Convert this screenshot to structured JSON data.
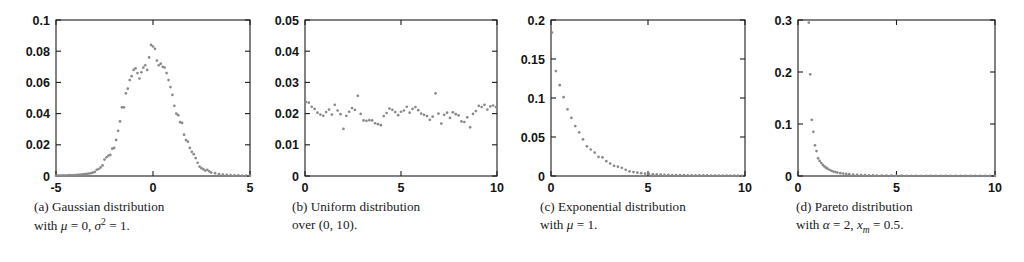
{
  "figure": {
    "background": "#ffffff",
    "marker_color": "#8a8a8a",
    "axis_color": "#1c1c1c",
    "panel_count": 4
  },
  "chart_data": [
    {
      "type": "scatter",
      "panel": "a",
      "title": "",
      "caption_line1": "(a) Gaussian distribution",
      "caption_line2_prefix": "with ",
      "caption_mu": "μ",
      "caption_line2_mid": " = 0, ",
      "caption_sigma": "σ",
      "caption_sigma_sup": "2",
      "caption_line2_end": " = 1.",
      "xlabel": "",
      "ylabel": "",
      "xlim": [
        -5,
        5
      ],
      "ylim": [
        0,
        0.1
      ],
      "xticks": [
        -5,
        0,
        5
      ],
      "xticklabels": [
        "-5",
        "0",
        "5"
      ],
      "yticks": [
        0,
        0.02,
        0.04,
        0.06,
        0.08,
        0.1
      ],
      "yticklabels": [
        "0",
        "0.02",
        "0.04",
        "0.06",
        "0.08",
        "0.1"
      ],
      "grid": false,
      "legend": null,
      "x": [
        -5.0,
        -4.9,
        -4.8,
        -4.7,
        -4.6,
        -4.5,
        -4.4,
        -4.3,
        -4.2,
        -4.1,
        -4.0,
        -3.9,
        -3.8,
        -3.7,
        -3.6,
        -3.5,
        -3.4,
        -3.3,
        -3.2,
        -3.1,
        -3.0,
        -2.9,
        -2.8,
        -2.7,
        -2.6,
        -2.5,
        -2.4,
        -2.3,
        -2.2,
        -2.1,
        -2.0,
        -1.9,
        -1.8,
        -1.7,
        -1.6,
        -1.5,
        -1.4,
        -1.3,
        -1.2,
        -1.1,
        -1.0,
        -0.9,
        -0.8,
        -0.7,
        -0.6,
        -0.5,
        -0.4,
        -0.3,
        -0.2,
        -0.1,
        0.0,
        0.1,
        0.2,
        0.3,
        0.4,
        0.5,
        0.6,
        0.7,
        0.8,
        0.9,
        1.0,
        1.1,
        1.2,
        1.3,
        1.4,
        1.5,
        1.6,
        1.7,
        1.8,
        1.9,
        2.0,
        2.1,
        2.2,
        2.3,
        2.4,
        2.5,
        2.6,
        2.7,
        2.8,
        2.9,
        3.0,
        3.2,
        3.4,
        3.6,
        3.8,
        4.0,
        4.2,
        4.4,
        4.6,
        4.8,
        5.0
      ],
      "y": [
        0.0002,
        0.0003,
        0.0002,
        0.0003,
        0.0004,
        0.0003,
        0.0004,
        0.0005,
        0.0004,
        0.0006,
        0.0006,
        0.0007,
        0.0008,
        0.0009,
        0.001,
        0.0012,
        0.0013,
        0.0016,
        0.0018,
        0.0022,
        0.0026,
        0.004,
        0.0045,
        0.0055,
        0.0068,
        0.0105,
        0.012,
        0.013,
        0.0135,
        0.0175,
        0.018,
        0.0231,
        0.029,
        0.035,
        0.044,
        0.044,
        0.053,
        0.056,
        0.0615,
        0.064,
        0.068,
        0.069,
        0.066,
        0.0625,
        0.0665,
        0.0695,
        0.071,
        0.068,
        0.076,
        0.084,
        0.083,
        0.0815,
        0.074,
        0.071,
        0.072,
        0.07,
        0.0695,
        0.066,
        0.0615,
        0.057,
        0.052,
        0.045,
        0.04,
        0.039,
        0.0345,
        0.034,
        0.0265,
        0.023,
        0.022,
        0.018,
        0.0155,
        0.014,
        0.0115,
        0.0085,
        0.006,
        0.005,
        0.0042,
        0.0035,
        0.004,
        0.003,
        0.0022,
        0.0018,
        0.0012,
        0.0009,
        0.0007,
        0.0005,
        0.0004,
        0.0004,
        0.0003,
        0.0002,
        0.0002
      ]
    },
    {
      "type": "scatter",
      "panel": "b",
      "title": "",
      "caption_line1": "(b) Uniform distribution",
      "caption_line2_plain": "over (0, 10).",
      "xlabel": "",
      "ylabel": "",
      "xlim": [
        0,
        10
      ],
      "ylim": [
        0,
        0.05
      ],
      "xticks": [
        0,
        5,
        10
      ],
      "xticklabels": [
        "0",
        "5",
        "10"
      ],
      "yticks": [
        0,
        0.01,
        0.02,
        0.03,
        0.04,
        0.05
      ],
      "yticklabels": [
        "0",
        "0.01",
        "0.02",
        "0.03",
        "0.04",
        "0.05"
      ],
      "grid": false,
      "legend": null,
      "x": [
        0.05,
        0.2,
        0.35,
        0.5,
        0.65,
        0.8,
        0.95,
        1.1,
        1.25,
        1.4,
        1.55,
        1.7,
        1.85,
        2.0,
        2.15,
        2.3,
        2.45,
        2.6,
        2.75,
        2.9,
        3.05,
        3.2,
        3.35,
        3.5,
        3.65,
        3.8,
        3.95,
        4.1,
        4.25,
        4.4,
        4.55,
        4.7,
        4.85,
        5.0,
        5.15,
        5.3,
        5.45,
        5.6,
        5.75,
        5.9,
        6.05,
        6.2,
        6.35,
        6.5,
        6.65,
        6.8,
        6.95,
        7.1,
        7.25,
        7.4,
        7.55,
        7.7,
        7.85,
        8.0,
        8.15,
        8.3,
        8.45,
        8.6,
        8.75,
        8.9,
        9.05,
        9.2,
        9.35,
        9.5,
        9.65,
        9.8,
        9.95
      ],
      "y": [
        0.0237,
        0.0235,
        0.0222,
        0.0215,
        0.0203,
        0.0197,
        0.0193,
        0.0205,
        0.0213,
        0.0197,
        0.0228,
        0.021,
        0.0198,
        0.0151,
        0.0193,
        0.0206,
        0.0218,
        0.0212,
        0.0257,
        0.0199,
        0.0178,
        0.0177,
        0.0179,
        0.0178,
        0.0169,
        0.0166,
        0.0163,
        0.0192,
        0.0202,
        0.0216,
        0.0212,
        0.0205,
        0.0195,
        0.0206,
        0.021,
        0.0222,
        0.0203,
        0.0215,
        0.0221,
        0.0211,
        0.02,
        0.0196,
        0.0192,
        0.018,
        0.019,
        0.0265,
        0.02,
        0.0168,
        0.0196,
        0.0203,
        0.0186,
        0.0204,
        0.0198,
        0.0194,
        0.0175,
        0.0173,
        0.0188,
        0.0156,
        0.0199,
        0.0208,
        0.0225,
        0.0221,
        0.0228,
        0.0213,
        0.0223,
        0.0226,
        0.0221
      ]
    },
    {
      "type": "scatter",
      "panel": "c",
      "title": "",
      "caption_line1": "(c) Exponential distribution",
      "caption_line2_prefix": "with ",
      "caption_mu": "μ",
      "caption_line2_end": " = 1.",
      "xlabel": "",
      "ylabel": "",
      "xlim": [
        0,
        10
      ],
      "ylim": [
        0,
        0.2
      ],
      "xticks": [
        0,
        5,
        10
      ],
      "xticklabels": [
        "0",
        "5",
        "10"
      ],
      "yticks": [
        0,
        0.05,
        0.1,
        0.15,
        0.2
      ],
      "yticklabels": [
        "0",
        "0.05",
        "0.1",
        "0.15",
        "0.2"
      ],
      "grid": false,
      "legend": null,
      "x": [
        0.05,
        0.25,
        0.45,
        0.65,
        0.85,
        1.05,
        1.25,
        1.45,
        1.65,
        1.85,
        2.05,
        2.25,
        2.45,
        2.65,
        2.85,
        3.05,
        3.25,
        3.45,
        3.65,
        3.85,
        4.05,
        4.25,
        4.45,
        4.65,
        4.85,
        5.05,
        5.25,
        5.45,
        5.65,
        5.85,
        6.05,
        6.25,
        6.45,
        6.65,
        6.85,
        7.05,
        7.25,
        7.45,
        7.65,
        7.85,
        8.05,
        8.25,
        8.45,
        8.65,
        8.85,
        9.05,
        9.25,
        9.45,
        9.65,
        9.85
      ],
      "y": [
        0.184,
        0.1345,
        0.1165,
        0.101,
        0.0855,
        0.0745,
        0.064,
        0.056,
        0.047,
        0.038,
        0.034,
        0.03,
        0.0245,
        0.024,
        0.019,
        0.016,
        0.013,
        0.012,
        0.0105,
        0.008,
        0.006,
        0.005,
        0.0042,
        0.0036,
        0.003,
        0.0026,
        0.0022,
        0.002,
        0.0018,
        0.0016,
        0.0014,
        0.0013,
        0.0012,
        0.0011,
        0.001,
        0.0009,
        0.0009,
        0.0008,
        0.0008,
        0.0007,
        0.0007,
        0.0006,
        0.0006,
        0.0005,
        0.0005,
        0.0005,
        0.0004,
        0.0004,
        0.0004,
        0.0003
      ]
    },
    {
      "type": "scatter",
      "panel": "d",
      "title": "",
      "caption_line1": "(d) Pareto distribution",
      "caption_line2_prefix": "with ",
      "caption_alpha": "α",
      "caption_line2_mid": " = 2, ",
      "caption_xm_base": "x",
      "caption_xm_sub": "m",
      "caption_line2_end": " = 0.5.",
      "xlabel": "",
      "ylabel": "",
      "xlim": [
        0,
        10
      ],
      "ylim": [
        0,
        0.3
      ],
      "xticks": [
        0,
        5,
        10
      ],
      "xticklabels": [
        "0",
        "5",
        "10"
      ],
      "yticks": [
        0,
        0.1,
        0.2,
        0.3
      ],
      "yticklabels": [
        "0",
        "0.1",
        "0.2",
        "0.3"
      ],
      "grid": false,
      "legend": null,
      "x": [
        0.55,
        0.62,
        0.7,
        0.78,
        0.86,
        0.94,
        1.02,
        1.1,
        1.18,
        1.26,
        1.34,
        1.42,
        1.5,
        1.6,
        1.7,
        1.8,
        1.9,
        2.0,
        2.15,
        2.3,
        2.45,
        2.6,
        2.8,
        3.0,
        3.2,
        3.4,
        3.6,
        3.8,
        4.0,
        4.25,
        4.5,
        4.75,
        5.0,
        5.25,
        5.5,
        5.75,
        6.0,
        6.25,
        6.5,
        6.75,
        7.0,
        7.25,
        7.5,
        7.75,
        8.0,
        8.25,
        8.5,
        8.75,
        9.0,
        9.25,
        9.5,
        9.75,
        10.0
      ],
      "y": [
        0.295,
        0.1955,
        0.108,
        0.085,
        0.059,
        0.048,
        0.034,
        0.029,
        0.025,
        0.0215,
        0.0185,
        0.016,
        0.014,
        0.012,
        0.01,
        0.0085,
        0.0075,
        0.0065,
        0.0055,
        0.0046,
        0.004,
        0.0035,
        0.0028,
        0.0023,
        0.0019,
        0.0016,
        0.0014,
        0.0012,
        0.001,
        0.0009,
        0.0008,
        0.0007,
        0.0006,
        0.0006,
        0.0005,
        0.0005,
        0.0004,
        0.0004,
        0.0004,
        0.0003,
        0.0003,
        0.0003,
        0.0003,
        0.0002,
        0.0002,
        0.0002,
        0.0002,
        0.0002,
        0.0002,
        0.0002,
        0.0001,
        0.0001,
        0.0001
      ]
    }
  ],
  "panel_geometry": [
    {
      "left": 56,
      "top": 20,
      "right": 250,
      "bottom": 176,
      "caption_x": 34,
      "caption_y": 198
    },
    {
      "left": 305,
      "top": 20,
      "right": 497,
      "bottom": 176,
      "caption_x": 292,
      "caption_y": 198
    },
    {
      "left": 551,
      "top": 20,
      "right": 745,
      "bottom": 176,
      "caption_x": 540,
      "caption_y": 198
    },
    {
      "left": 798,
      "top": 20,
      "right": 995,
      "bottom": 176,
      "caption_x": 796,
      "caption_y": 198
    }
  ]
}
